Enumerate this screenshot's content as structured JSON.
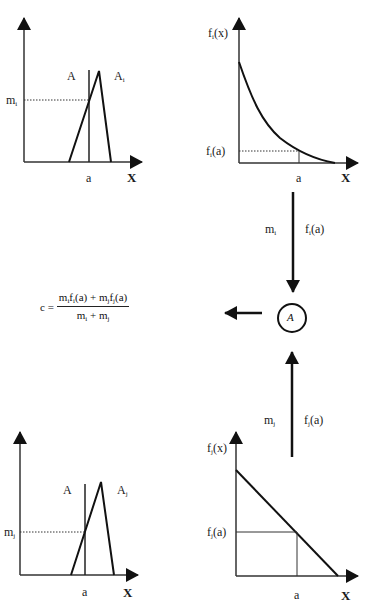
{
  "panels": {
    "top_left": {
      "set_label": "A",
      "fuzzy_label": "A",
      "fuzzy_sub": "i",
      "membership_label": "m",
      "membership_sub": "i",
      "x_point": "a",
      "x_axis": "X"
    },
    "top_right": {
      "func_label": "f",
      "func_sub": "i",
      "func_arg": "(x)",
      "value_label": "f",
      "value_sub": "i",
      "value_arg": "(a)",
      "x_point": "a",
      "x_axis": "X",
      "curve": "exponential-decay"
    },
    "bottom_left": {
      "set_label": "A",
      "fuzzy_label": "A",
      "fuzzy_sub": "j",
      "membership_label": "m",
      "membership_sub": "j",
      "x_point": "a",
      "x_axis": "X"
    },
    "bottom_right": {
      "func_label": "f",
      "func_sub": "j",
      "func_arg": "(x)",
      "value_label": "f",
      "value_sub": "j",
      "value_arg": "(a)",
      "x_point": "a",
      "x_axis": "X",
      "curve": "linear-decreasing"
    }
  },
  "flows": {
    "down": {
      "left_label": "m",
      "left_sub": "i",
      "right_label": "f",
      "right_sub": "i",
      "right_arg": "(a)"
    },
    "up": {
      "left_label": "m",
      "left_sub": "j",
      "right_label": "f",
      "right_sub": "j",
      "right_arg": "(a)"
    }
  },
  "node": {
    "label": "A"
  },
  "formula": {
    "lhs": "c =",
    "num": {
      "t1": "m",
      "s1": "i",
      "t2": "f",
      "s2": "i",
      "t3": "(a) + m",
      "s3": "j",
      "t4": "f",
      "s4": "j",
      "t5": "(a)"
    },
    "den": {
      "t1": "m",
      "s1": "i",
      "t2": " + m",
      "s2": "j"
    }
  }
}
